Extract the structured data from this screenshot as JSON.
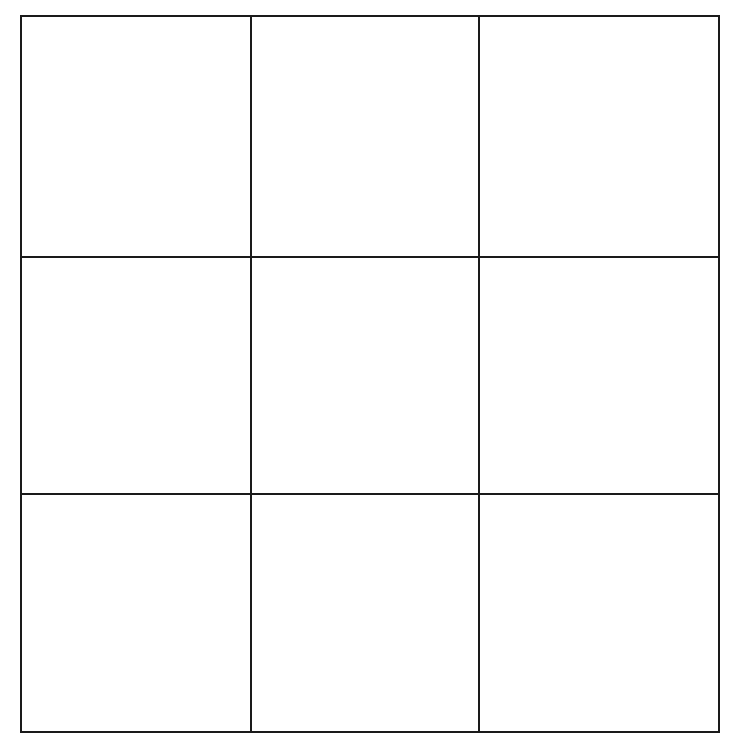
{
  "game": {
    "type": "tic-tac-toe",
    "rows": 3,
    "cols": 3,
    "line_color": "#1a1a1a",
    "background": "#ffffff",
    "cells": [
      [
        "",
        "",
        ""
      ],
      [
        "",
        "",
        ""
      ],
      [
        "",
        "",
        ""
      ]
    ]
  }
}
